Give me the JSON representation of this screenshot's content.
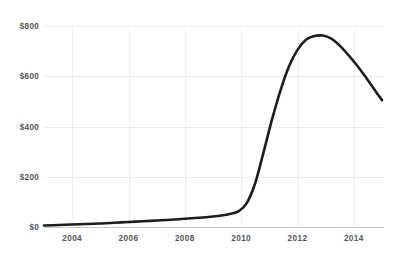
{
  "chart_title": "",
  "chart_data": {
    "type": "line",
    "title": "",
    "subtitle": "",
    "xlabel": "",
    "ylabel": "",
    "grid": true,
    "legend": false,
    "legend_position": "none",
    "line_color": "#1d1d1d",
    "grid_color": "#ececee",
    "axis_color": "#c9c9cc",
    "tick_label_color": "#54555a",
    "xlim": [
      2003.0,
      2015.0
    ],
    "ylim": [
      0,
      800
    ],
    "x_ticks": [
      2004,
      2006,
      2008,
      2010,
      2012,
      2014
    ],
    "x_tick_labels": [
      "2004",
      "2006",
      "2008",
      "2010",
      "2012",
      "2014"
    ],
    "y_ticks": [
      0,
      200,
      400,
      600,
      800
    ],
    "y_tick_labels": [
      "$0",
      "$200",
      "$400",
      "$600",
      "$800"
    ],
    "series": [
      {
        "name": "value",
        "x": [
          2003.0,
          2003.5,
          2004.0,
          2004.5,
          2005.0,
          2005.5,
          2006.0,
          2006.5,
          2007.0,
          2007.5,
          2008.0,
          2008.5,
          2009.0,
          2009.3,
          2009.6,
          2009.9,
          2010.2,
          2010.5,
          2010.8,
          2011.1,
          2011.4,
          2011.7,
          2012.0,
          2012.3,
          2012.6,
          2012.9,
          2013.2,
          2013.5,
          2013.8,
          2014.1,
          2014.4,
          2014.7,
          2015.0
        ],
        "y": [
          6,
          8,
          10,
          12,
          14,
          17,
          20,
          23,
          26,
          29,
          33,
          37,
          42,
          46,
          52,
          62,
          95,
          175,
          300,
          430,
          545,
          640,
          705,
          745,
          760,
          762,
          750,
          722,
          685,
          645,
          600,
          552,
          505
        ]
      }
    ]
  },
  "y_axis": {
    "labels": [
      {
        "text": "$800",
        "value": 800
      },
      {
        "text": "$600",
        "value": 600
      },
      {
        "text": "$400",
        "value": 400
      },
      {
        "text": "$200",
        "value": 200
      },
      {
        "text": "$0",
        "value": 0
      }
    ]
  },
  "x_axis": {
    "labels": [
      {
        "text": "2004",
        "value": 2004
      },
      {
        "text": "2006",
        "value": 2006
      },
      {
        "text": "2008",
        "value": 2008
      },
      {
        "text": "2010",
        "value": 2010
      },
      {
        "text": "2012",
        "value": 2012
      },
      {
        "text": "2014",
        "value": 2014
      }
    ]
  }
}
